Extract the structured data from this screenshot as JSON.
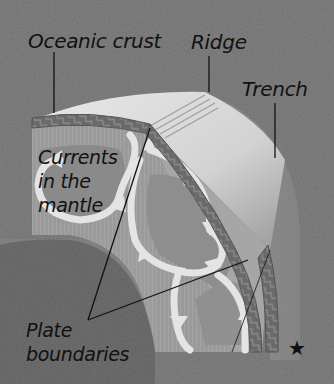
{
  "diagram": {
    "background_color": "#6e6e6e",
    "colors": {
      "crust": "#7a7a7a",
      "crust_edge": "#565656",
      "mantle_outer": "#a9a9a9",
      "mantle_inner": "#8f8f8f",
      "currents": "#e4e4e4",
      "core": "#5e5e5e",
      "surface": "#dcdcdc",
      "label_text": "#111111",
      "leader_line": "#111111"
    },
    "labels": {
      "oceanic_crust": "Oceanic crust",
      "ridge": "Ridge",
      "trench": "Trench",
      "currents": "Currents\nin the\nmantle",
      "plate_boundaries": "Plate\nboundaries"
    },
    "marker": {
      "symbol": "★",
      "name": "star-marker"
    }
  }
}
